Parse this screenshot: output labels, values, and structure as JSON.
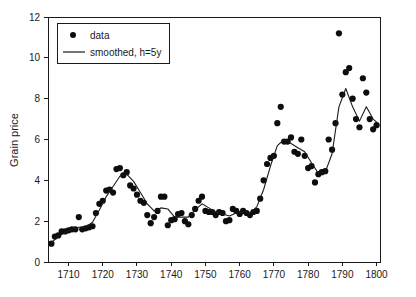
{
  "chart_data": {
    "type": "scatter",
    "title": "",
    "xlabel": "",
    "ylabel": "Grain price",
    "xlim": [
      1704,
      1801
    ],
    "ylim": [
      0,
      12
    ],
    "xticks": [
      1710,
      1720,
      1730,
      1740,
      1750,
      1760,
      1770,
      1780,
      1790,
      1800
    ],
    "yticks": [
      0,
      2,
      4,
      6,
      8,
      10,
      12
    ],
    "grid": false,
    "legend_position": "top-left",
    "series": [
      {
        "name": "data",
        "type": "scatter",
        "marker": "circle",
        "color": "#0d0d0d",
        "x": [
          1705,
          1706,
          1707,
          1708,
          1709,
          1710,
          1711,
          1712,
          1713,
          1714,
          1715,
          1716,
          1717,
          1718,
          1719,
          1720,
          1721,
          1722,
          1723,
          1724,
          1725,
          1726,
          1727,
          1728,
          1729,
          1730,
          1731,
          1732,
          1733,
          1734,
          1735,
          1736,
          1737,
          1738,
          1739,
          1740,
          1741,
          1742,
          1743,
          1744,
          1745,
          1746,
          1747,
          1748,
          1749,
          1750,
          1751,
          1752,
          1753,
          1754,
          1755,
          1756,
          1757,
          1758,
          1759,
          1760,
          1761,
          1762,
          1763,
          1764,
          1765,
          1766,
          1767,
          1768,
          1769,
          1770,
          1771,
          1772,
          1773,
          1774,
          1775,
          1776,
          1777,
          1778,
          1779,
          1780,
          1781,
          1782,
          1783,
          1784,
          1785,
          1786,
          1787,
          1788,
          1789,
          1790,
          1791,
          1792,
          1793,
          1794,
          1795,
          1796,
          1797,
          1798,
          1799,
          1800
        ],
        "y": [
          0.9,
          1.25,
          1.3,
          1.5,
          1.5,
          1.55,
          1.6,
          1.6,
          2.2,
          1.6,
          1.65,
          1.7,
          1.75,
          2.4,
          2.85,
          3.0,
          3.5,
          3.55,
          3.4,
          4.55,
          4.6,
          4.25,
          4.4,
          3.75,
          3.6,
          3.3,
          3.0,
          2.9,
          2.3,
          1.9,
          2.2,
          2.5,
          3.2,
          3.2,
          1.8,
          2.05,
          2.1,
          2.35,
          2.4,
          2.0,
          1.85,
          2.3,
          2.6,
          3.0,
          3.2,
          2.5,
          2.45,
          2.45,
          2.3,
          2.45,
          2.4,
          2.0,
          2.05,
          2.6,
          2.5,
          2.35,
          2.5,
          2.4,
          2.3,
          2.45,
          2.5,
          3.1,
          4.0,
          4.8,
          5.1,
          5.2,
          6.8,
          7.6,
          5.9,
          5.9,
          6.1,
          5.4,
          5.3,
          6.0,
          5.2,
          4.6,
          4.7,
          3.9,
          4.3,
          4.4,
          4.45,
          6.0,
          5.5,
          6.8,
          11.2,
          8.2,
          9.3,
          9.5,
          8.0,
          7.0,
          6.6,
          9.0,
          8.3,
          7.0,
          6.5,
          6.7
        ]
      },
      {
        "name": "smoothed, h=5y",
        "type": "line",
        "color": "#1a1a1a",
        "x": [
          1705,
          1707,
          1709,
          1711,
          1713,
          1715,
          1717,
          1719,
          1721,
          1723,
          1725,
          1727,
          1729,
          1731,
          1733,
          1735,
          1737,
          1739,
          1741,
          1743,
          1745,
          1747,
          1749,
          1751,
          1753,
          1755,
          1757,
          1759,
          1761,
          1763,
          1765,
          1767,
          1769,
          1771,
          1773,
          1775,
          1777,
          1779,
          1781,
          1783,
          1785,
          1787,
          1789,
          1791,
          1793,
          1795,
          1797,
          1799,
          1800
        ],
        "y": [
          0.95,
          1.25,
          1.45,
          1.6,
          1.7,
          1.7,
          1.95,
          2.55,
          3.2,
          3.7,
          4.2,
          4.3,
          3.95,
          3.4,
          2.85,
          2.5,
          2.65,
          2.6,
          2.2,
          2.2,
          2.2,
          2.55,
          2.85,
          2.65,
          2.45,
          2.35,
          2.25,
          2.4,
          2.45,
          2.4,
          2.7,
          3.55,
          4.7,
          5.7,
          6.0,
          5.8,
          5.6,
          5.4,
          4.85,
          4.35,
          4.4,
          5.3,
          7.6,
          8.5,
          7.6,
          6.9,
          7.6,
          7.0,
          6.85
        ]
      }
    ],
    "legend_entries": [
      {
        "label": "data",
        "marker": "circle"
      },
      {
        "label": "smoothed, h=5y",
        "marker": "line"
      }
    ]
  }
}
